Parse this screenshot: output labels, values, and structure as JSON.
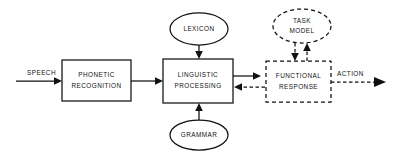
{
  "diagram": {
    "canvas": {
      "width": 401,
      "height": 161,
      "background": "#ffffff"
    },
    "stroke_color": "#111111",
    "nodes": {
      "phonetic_recognition": {
        "label_line1": "PHONETIC",
        "label_line2": "RECOGNITION",
        "shape": "rectangle",
        "border": "solid"
      },
      "linguistic_processing": {
        "label_line1": "LINGUISTIC",
        "label_line2": "PROCESSING",
        "shape": "rectangle",
        "border": "solid"
      },
      "functional_response": {
        "label_line1": "FUNCTIONAL",
        "label_line2": "RESPONSE",
        "shape": "rectangle",
        "border": "dashed"
      },
      "lexicon": {
        "label": "LEXICON",
        "shape": "ellipse",
        "border": "solid"
      },
      "grammar": {
        "label": "GRAMMAR",
        "shape": "ellipse",
        "border": "solid"
      },
      "task_model": {
        "label_line1": "TASK",
        "label_line2": "MODEL",
        "shape": "ellipse",
        "border": "dashed"
      }
    },
    "edges": {
      "speech_input": {
        "label": "SPEECH",
        "style": "solid",
        "direction": "right",
        "from": "input",
        "to": "phonetic_recognition"
      },
      "phonetic_to_linguistic": {
        "label": "",
        "style": "solid",
        "direction": "right",
        "from": "phonetic_recognition",
        "to": "linguistic_processing"
      },
      "lexicon_to_linguistic": {
        "label": "",
        "style": "solid",
        "direction": "down",
        "from": "lexicon",
        "to": "linguistic_processing"
      },
      "grammar_to_linguistic": {
        "label": "",
        "style": "solid",
        "direction": "up",
        "from": "grammar",
        "to": "linguistic_processing"
      },
      "linguistic_to_functional": {
        "label": "",
        "style": "solid",
        "direction": "right",
        "from": "linguistic_processing",
        "to": "functional_response"
      },
      "functional_to_linguistic": {
        "label": "",
        "style": "dashed",
        "direction": "left",
        "from": "functional_response",
        "to": "linguistic_processing"
      },
      "taskmodel_to_functional": {
        "label": "",
        "style": "dashed",
        "direction": "down",
        "from": "task_model",
        "to": "functional_response"
      },
      "functional_to_taskmodel": {
        "label": "",
        "style": "dashed",
        "direction": "up",
        "from": "functional_response",
        "to": "task_model"
      },
      "action_output": {
        "label": "ACTION",
        "style": "dashed",
        "direction": "right",
        "from": "functional_response",
        "to": "output"
      }
    }
  }
}
